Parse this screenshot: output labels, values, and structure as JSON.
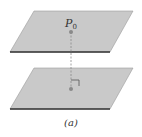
{
  "figure": {
    "point_label": "P",
    "point_subscript": "0",
    "caption": "(a)"
  },
  "colors": {
    "plane_fill": "#c9c9c9",
    "plane_edge": "#333333",
    "point": "#8a8a8a",
    "dashed_line": "#8a8a8a"
  }
}
